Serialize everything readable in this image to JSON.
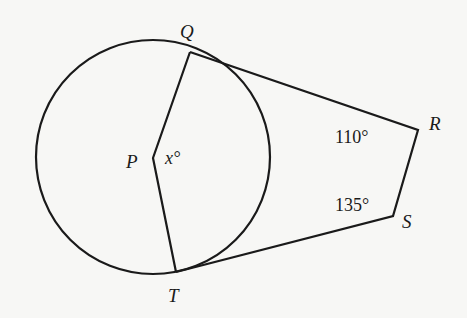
{
  "diagram": {
    "type": "circle-with-tangents-quadrilateral",
    "points": {
      "Q": {
        "label": "Q",
        "x": 190,
        "y": 52
      },
      "P": {
        "label": "P",
        "x": 153,
        "y": 158
      },
      "T": {
        "label": "T",
        "x": 176,
        "y": 272
      },
      "R": {
        "label": "R",
        "x": 418,
        "y": 130
      },
      "S": {
        "label": "S",
        "x": 393,
        "y": 216
      }
    },
    "circle": {
      "center": "P",
      "cx": 153,
      "cy": 157,
      "r": 117
    },
    "angles": {
      "P": "x°",
      "R": "110°",
      "S": "135°"
    },
    "segments": [
      "PQ",
      "PT",
      "QR",
      "RS",
      "ST"
    ]
  }
}
